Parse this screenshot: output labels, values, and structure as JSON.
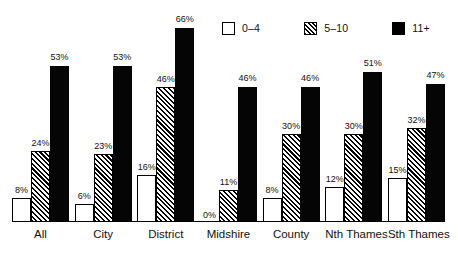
{
  "chart_data": {
    "type": "bar",
    "title": "",
    "subtitle": "",
    "xlabel": "",
    "ylabel": "",
    "ylim": [
      0,
      70
    ],
    "grid": false,
    "legend_position": "top-right",
    "value_suffix": "%",
    "categories": [
      "All",
      "City",
      "District",
      "Midshire",
      "County",
      "Nth Thames",
      "Sth Thames"
    ],
    "series": [
      {
        "name": "0–4",
        "style": "open",
        "values": [
          8,
          6,
          16,
          0,
          8,
          12,
          15
        ]
      },
      {
        "name": "5–10",
        "style": "hatched",
        "values": [
          24,
          23,
          46,
          11,
          30,
          30,
          32
        ]
      },
      {
        "name": "11+",
        "style": "solid",
        "values": [
          53,
          53,
          66,
          46,
          46,
          51,
          47
        ]
      }
    ],
    "value_labels": [
      [
        "8%",
        "6%",
        "16%",
        "0%",
        "8%",
        "12%",
        "15%"
      ],
      [
        "24%",
        "23%",
        "46%",
        "11%",
        "30%",
        "30%",
        "32%"
      ],
      [
        "53%",
        "53%",
        "66%",
        "46%",
        "46%",
        "51%",
        "47%"
      ]
    ]
  },
  "legend": {
    "items": [
      {
        "label": "0–4",
        "swatch": "open-square-icon"
      },
      {
        "label": "5–10",
        "swatch": "hatched-square-icon"
      },
      {
        "label": "11+",
        "swatch": "solid-square-icon"
      }
    ]
  },
  "colors": {
    "bar_solid": "#050505",
    "bar_open_fill": "#ffffff",
    "outline": "#000000",
    "text": "#111111",
    "background": "#ffffff"
  }
}
